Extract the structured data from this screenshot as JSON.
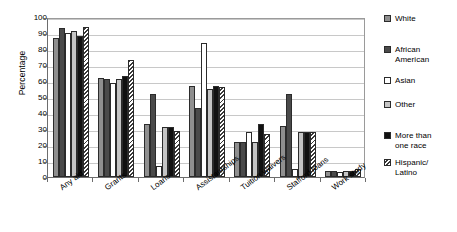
{
  "chart_data": {
    "type": "bar",
    "title": "",
    "xlabel": "",
    "ylabel": "Percentage",
    "ylim": [
      0,
      100
    ],
    "ytick_step": 10,
    "yticks": [
      0,
      10,
      20,
      30,
      40,
      50,
      60,
      70,
      80,
      90,
      100
    ],
    "grid": true,
    "legend_position": "right",
    "categories": [
      "Any aid",
      "Grants",
      "Loans",
      "Assistantships",
      "Tuition waivers",
      "Stafford loans",
      "Work study"
    ],
    "series": [
      {
        "name": "White",
        "color": "#8f8f8f",
        "pattern": "solid-medium-gray",
        "values": [
          87,
          62,
          33,
          57,
          22,
          32,
          4
        ]
      },
      {
        "name": "African American",
        "color": "#4a4a4a",
        "pattern": "solid-dark-gray",
        "values": [
          93,
          61,
          52,
          43,
          22,
          52,
          4
        ]
      },
      {
        "name": "Asian",
        "color": "#ffffff",
        "pattern": "empty-white",
        "values": [
          90,
          59,
          7,
          84,
          28,
          5,
          3
        ]
      },
      {
        "name": "Other",
        "color": "#c4c4c4",
        "pattern": "solid-light-gray",
        "values": [
          91,
          61,
          31,
          55,
          22,
          28,
          4
        ]
      },
      {
        "name": "More than one race",
        "color": "#111111",
        "pattern": "solid-black",
        "values": [
          88,
          63,
          31,
          57,
          33,
          28,
          4
        ]
      },
      {
        "name": "Hispanic/Latino",
        "color": "#ffffff",
        "pattern": "diagonal-hatch",
        "values": [
          94,
          73,
          29,
          56,
          27,
          28,
          5
        ]
      }
    ]
  },
  "legend": {
    "entries": [
      {
        "label_line1": "White",
        "label_line2": ""
      },
      {
        "label_line1": "African",
        "label_line2": "American"
      },
      {
        "label_line1": "Asian",
        "label_line2": ""
      },
      {
        "label_line1": "Other",
        "label_line2": ""
      },
      {
        "label_line1": "More than",
        "label_line2": "one race"
      },
      {
        "label_line1": "Hispanic/",
        "label_line2": "Latino"
      }
    ]
  }
}
